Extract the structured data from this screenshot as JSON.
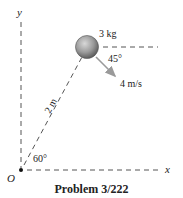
{
  "diagram": {
    "axes": {
      "y_label": "y",
      "x_label": "x",
      "origin_label": "O"
    },
    "particle": {
      "mass_label": "3 kg",
      "velocity_label": "4 m/s",
      "velocity_angle_label": "45°",
      "color": "#8a8a8a"
    },
    "rod": {
      "length_label": "2 m",
      "angle_label": "60°"
    },
    "caption": "Problem 3/222"
  }
}
